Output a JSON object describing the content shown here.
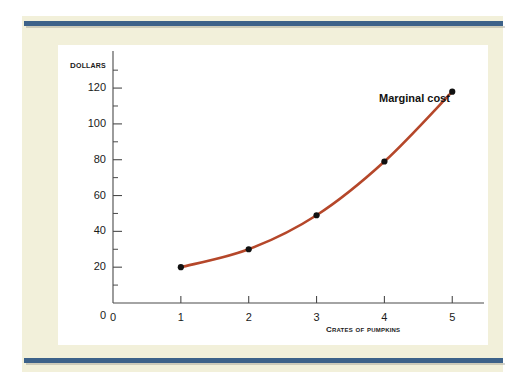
{
  "figure": {
    "frame_color": "#3d6289",
    "page_background": "#f2f0da",
    "plot_background": "#ffffff"
  },
  "chart_data": {
    "type": "line",
    "title": "",
    "subtitle": "",
    "xlabel": "Crates of pumpkins",
    "ylabel": "Dollars",
    "xlim": [
      0,
      5.35
    ],
    "ylim": [
      0,
      134
    ],
    "grid": false,
    "legend_position": "inline-annotation",
    "series": [
      {
        "name": "Marginal cost",
        "color": "#b5472a",
        "marker": "filled-circle",
        "marker_color": "#111111",
        "x": [
          1,
          2,
          3,
          4,
          5
        ],
        "values": [
          20,
          30,
          49,
          79,
          118
        ]
      }
    ],
    "annotations": [
      {
        "text": "Marginal cost",
        "x": 4.35,
        "y": 121
      }
    ],
    "x_ticks": [
      0,
      1,
      2,
      3,
      4,
      5
    ],
    "x_tick_labels": [
      "0",
      "1",
      "2",
      "3",
      "4",
      "5"
    ],
    "y_ticks": [
      0,
      20,
      40,
      60,
      80,
      100,
      120
    ],
    "y_tick_labels": [
      "0",
      "20",
      "40",
      "60",
      "80",
      "100",
      "120"
    ],
    "y_minor_ticks": [
      10,
      30,
      50,
      70,
      90,
      110,
      130
    ]
  }
}
